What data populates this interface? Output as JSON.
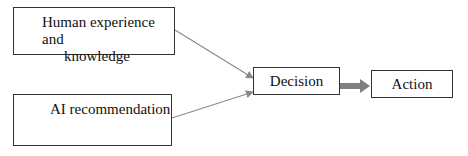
{
  "diagram": {
    "nodes": [
      {
        "id": "human",
        "line1": "Human experience and",
        "line2": "knowledge"
      },
      {
        "id": "ai",
        "label": "AI recommendation"
      },
      {
        "id": "decision",
        "label": "Decision"
      },
      {
        "id": "action",
        "label": "Action"
      }
    ],
    "edges": [
      {
        "from": "human",
        "to": "decision",
        "style": "thin-arrow"
      },
      {
        "from": "ai",
        "to": "decision",
        "style": "thin-arrow"
      },
      {
        "from": "decision",
        "to": "action",
        "style": "thick-arrow"
      }
    ],
    "colors": {
      "border": "#333333",
      "arrow": "#8a8a8a",
      "thick_arrow": "#7f7f7f"
    }
  }
}
